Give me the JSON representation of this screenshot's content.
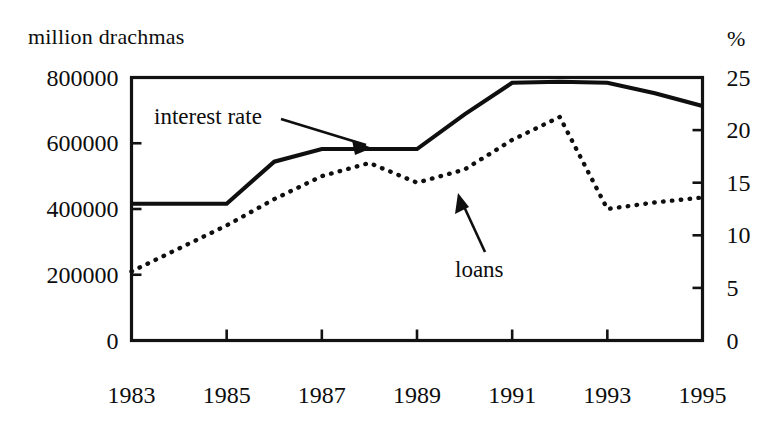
{
  "figure": {
    "left_unit_label": "million drachmas",
    "right_unit_label": "%",
    "callouts": {
      "interest_rate": "interest rate",
      "loans": "loans"
    }
  },
  "chart_data": {
    "type": "line",
    "title": "",
    "subtitle": "",
    "xlabel": "",
    "ylabel": "million drachmas",
    "y2label": "%",
    "grid": false,
    "legend": "annotated-inline",
    "x": [
      1983,
      1984,
      1985,
      1986,
      1987,
      1988,
      1989,
      1990,
      1991,
      1992,
      1993,
      1994,
      1995
    ],
    "xlim": [
      1983,
      1995
    ],
    "xticks": [
      1983,
      1985,
      1987,
      1989,
      1991,
      1993,
      1995
    ],
    "xtick_labels": [
      "1983",
      "1985",
      "1987",
      "1989",
      "1991",
      "1993",
      "1995"
    ],
    "ylim": [
      0,
      800000
    ],
    "yticks": [
      0,
      200000,
      400000,
      600000,
      800000
    ],
    "ytick_labels": [
      "0",
      "200000",
      "400000",
      "600000",
      "800000"
    ],
    "y2lim": [
      0,
      25
    ],
    "y2ticks": [
      0,
      5,
      10,
      15,
      20,
      25
    ],
    "y2tick_labels": [
      "0",
      "5",
      "10",
      "15",
      "20",
      "25"
    ],
    "series": [
      {
        "name": "interest rate",
        "axis": "right",
        "unit": "%",
        "style": "solid",
        "values": [
          13.0,
          13.0,
          13.0,
          17.0,
          18.2,
          18.2,
          18.2,
          21.5,
          24.5,
          24.6,
          24.5,
          23.5,
          22.3
        ]
      },
      {
        "name": "loans",
        "axis": "left",
        "unit": "million drachmas",
        "style": "dotted",
        "values": [
          210000,
          280000,
          350000,
          430000,
          500000,
          540000,
          480000,
          520000,
          610000,
          680000,
          400000,
          420000,
          435000
        ]
      }
    ]
  }
}
